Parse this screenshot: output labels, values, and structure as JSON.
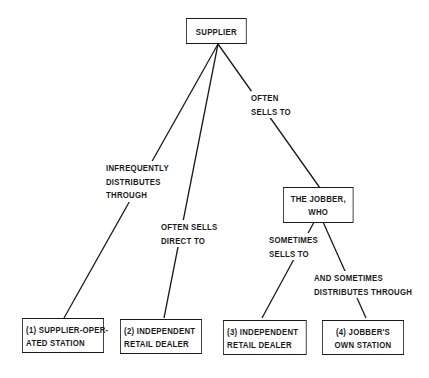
{
  "diagram": {
    "type": "tree",
    "nodes": {
      "supplier": {
        "lines": [
          "SUPPLIER"
        ]
      },
      "jobber": {
        "lines": [
          "THE JOBBER,",
          "WHO"
        ]
      },
      "station1": {
        "lines": [
          "(1) SUPPLIER-OPER-",
          "ATED STATION"
        ]
      },
      "dealer2": {
        "lines": [
          "(2) INDEPENDENT",
          "RETAIL DEALER"
        ]
      },
      "dealer3": {
        "lines": [
          "(3) INDEPENDENT",
          "RETAIL DEALER"
        ]
      },
      "station4": {
        "lines": [
          "(4) JOBBER'S",
          "OWN STATION"
        ]
      }
    },
    "edge_labels": {
      "supplier_to_station1": [
        "INFREQUENTLY",
        "DISTRIBUTES",
        "THROUGH"
      ],
      "supplier_to_dealer2": [
        "OFTEN SELLS",
        "DIRECT TO"
      ],
      "supplier_to_jobber": [
        "OFTEN",
        "SELLS TO"
      ],
      "jobber_to_dealer3": [
        "SOMETIMES",
        "SELLS TO"
      ],
      "jobber_to_station4": [
        "AND SOMETIMES",
        "DISTRIBUTES THROUGH"
      ]
    },
    "edges": [
      {
        "from": "supplier",
        "to": "station1"
      },
      {
        "from": "supplier",
        "to": "dealer2"
      },
      {
        "from": "supplier",
        "to": "jobber"
      },
      {
        "from": "jobber",
        "to": "dealer3"
      },
      {
        "from": "jobber",
        "to": "station4"
      }
    ],
    "colors": {
      "ink": "#1a1a1a",
      "background": "#ffffff"
    }
  }
}
